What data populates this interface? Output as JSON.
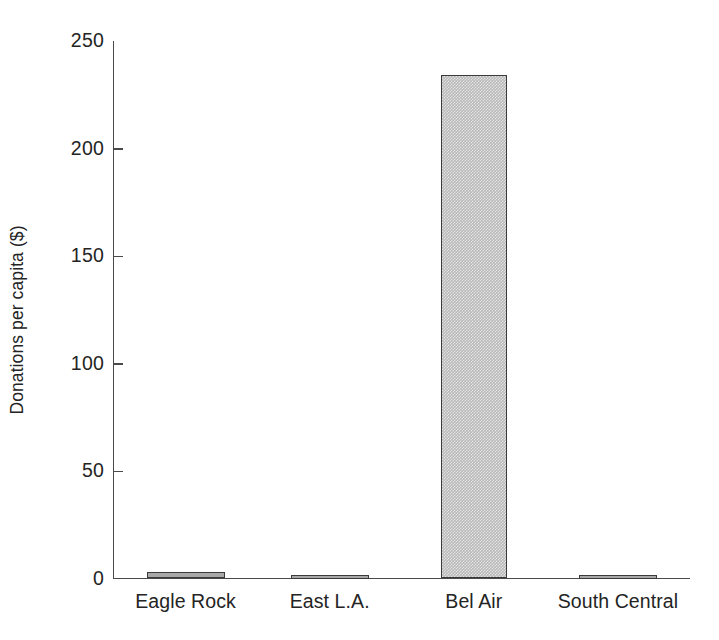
{
  "chart_data": {
    "type": "bar",
    "title": "",
    "subtitle": "",
    "xlabel": "",
    "ylabel": "Donations per capita ($)",
    "categories": [
      "Eagle Rock",
      "East L.A.",
      "Bel Air",
      "South Central"
    ],
    "values": [
      3,
      1,
      234,
      1
    ],
    "series": [
      {
        "name": "Donations per capita",
        "values": [
          3,
          1,
          234,
          1
        ]
      }
    ],
    "ylim": [
      0,
      250
    ],
    "yticks": [
      0,
      50,
      100,
      150,
      200,
      250
    ],
    "ytick_labels": [
      "0",
      "50",
      "100",
      "150",
      "200",
      "250"
    ],
    "xtick_labels": [
      "Eagle Rock",
      "East L.A.",
      "Bel Air",
      "South Central"
    ],
    "grid": false,
    "legend": false,
    "legend_position": "none",
    "annotations": [],
    "colors": {
      "bar_fill": "#b9b9b9",
      "bar_edge": "#3a3a3a",
      "axis": "#4a4a4a",
      "text": "#242424",
      "background": "#ffffff"
    },
    "axis_style": {
      "y_tick_direction": "in",
      "x_tick_direction": "none",
      "spines": [
        "left",
        "bottom"
      ]
    }
  }
}
